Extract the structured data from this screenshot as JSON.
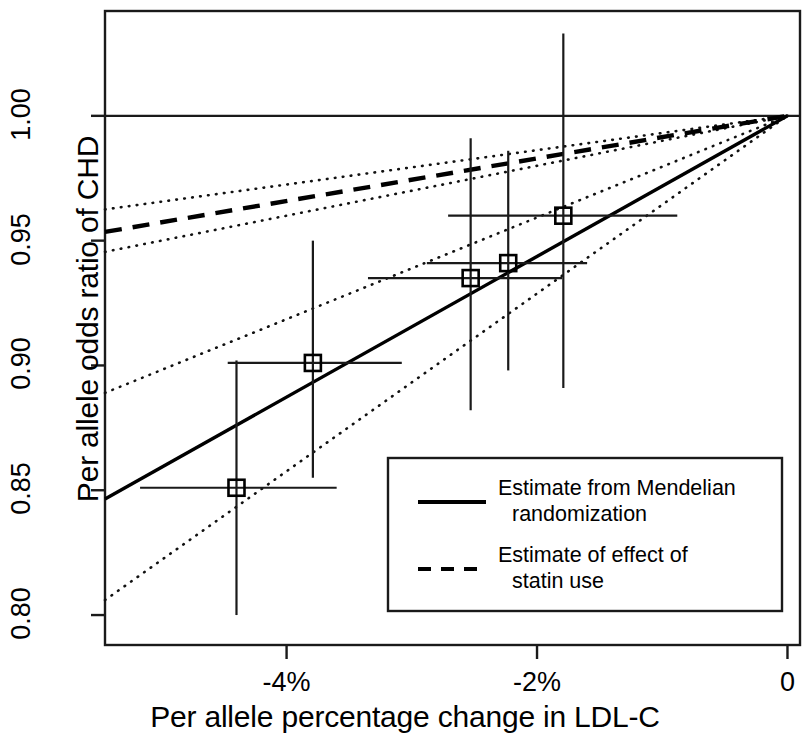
{
  "chart_data": {
    "type": "scatter",
    "title": "",
    "xlabel": "Per allele percentage change in LDL-C",
    "ylabel": "Per allele odds ratio of CHD",
    "xlim": [
      -5.45,
      0.1
    ],
    "ylim": [
      0.788,
      1.042
    ],
    "xticks": [
      -4,
      -2,
      0
    ],
    "xticklabels": [
      "-4%",
      "-2%",
      "0"
    ],
    "yticks": [
      0.8,
      0.85,
      0.9,
      0.95,
      1.0
    ],
    "yticklabels": [
      "0.80",
      "0.85",
      "0.90",
      "0.95",
      "1.00"
    ],
    "grid": false,
    "reference_line_y": 1.0,
    "points": [
      {
        "x": -4.4,
        "y": 0.851,
        "x_lo": -5.17,
        "x_hi": -3.6,
        "y_lo": 0.8,
        "y_hi": 0.902
      },
      {
        "x": -3.79,
        "y": 0.901,
        "x_lo": -4.47,
        "x_hi": -3.08,
        "y_lo": 0.855,
        "y_hi": 0.95
      },
      {
        "x": -2.53,
        "y": 0.935,
        "x_lo": -3.35,
        "x_hi": -1.8,
        "y_lo": 0.882,
        "y_hi": 0.991
      },
      {
        "x": -2.23,
        "y": 0.941,
        "x_lo": -2.88,
        "x_hi": -1.6,
        "y_lo": 0.898,
        "y_hi": 0.986
      },
      {
        "x": -1.79,
        "y": 0.96,
        "x_lo": -2.71,
        "x_hi": -0.88,
        "y_lo": 0.891,
        "y_hi": 1.033
      }
    ],
    "series": [
      {
        "name": "Estimate from Mendelian randomization",
        "style": "solid",
        "from": [
          -5.45,
          0.8465
        ],
        "to": [
          0,
          1.0
        ],
        "ci_upper_from": [
          -5.45,
          0.889
        ],
        "ci_lower_from": [
          -5.45,
          0.806
        ]
      },
      {
        "name": "Estimate of effect of statin use",
        "style": "dashed",
        "from": [
          -5.45,
          0.9535
        ],
        "to": [
          0,
          1.0
        ],
        "ci_upper_from": [
          -5.45,
          0.9625
        ],
        "ci_lower_from": [
          -5.45,
          0.9455
        ]
      }
    ],
    "legend": {
      "position": "bottom-right",
      "entries": [
        {
          "key": "solid",
          "line1": "Estimate from Mendelian",
          "line2": "randomization"
        },
        {
          "key": "dashed",
          "line1": "Estimate of effect of",
          "line2": "statin use"
        }
      ]
    },
    "colors": {
      "line": "#000000",
      "background": "#ffffff",
      "frame": "#000000"
    }
  }
}
